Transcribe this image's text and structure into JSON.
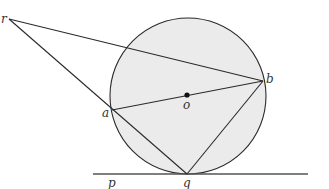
{
  "diagram": {
    "type": "geometry",
    "colors": {
      "circle_fill": "#ebebeb",
      "stroke": "#2a2a2a",
      "tangent_line": "#555555",
      "background": "#ffffff"
    },
    "circle": {
      "cx": 188,
      "cy": 96,
      "r": 78
    },
    "points": {
      "r": {
        "label": "r",
        "x": 9,
        "y": 19
      },
      "a": {
        "label": "a",
        "x": 112,
        "y": 110
      },
      "b": {
        "label": "b",
        "x": 263,
        "y": 81
      },
      "o": {
        "label": "o",
        "x": 187,
        "y": 95
      },
      "q": {
        "label": "q",
        "x": 187,
        "y": 174
      },
      "p": {
        "label": "p",
        "x": 112,
        "y": 174
      }
    },
    "labels": {
      "r": "r",
      "a": "a",
      "b": "b",
      "o": "o",
      "p": "p",
      "q": "q"
    },
    "segments": [
      {
        "from": "r",
        "to": "b"
      },
      {
        "from": "r",
        "to": "q"
      },
      {
        "from": "a",
        "to": "b"
      },
      {
        "from": "a",
        "to": "q"
      },
      {
        "from": "b",
        "to": "q"
      }
    ],
    "tangent": {
      "through": [
        "p",
        "q"
      ],
      "x1": 93,
      "x2": 308,
      "y": 174
    }
  }
}
